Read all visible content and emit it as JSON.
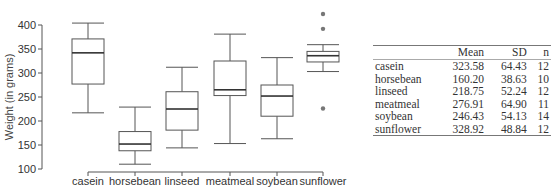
{
  "chart_data": {
    "type": "box",
    "title": "",
    "xlabel": "",
    "ylabel": "Weight (in grams)",
    "ylim": [
      100,
      430
    ],
    "yticks": [
      100,
      150,
      200,
      250,
      300,
      350,
      400
    ],
    "grid": false,
    "categories": [
      "casein",
      "horsebean",
      "linseed",
      "meatmeal",
      "soybean",
      "sunflower"
    ],
    "boxes": [
      {
        "name": "casein",
        "whisker_low": 217,
        "q1": 277,
        "median": 342,
        "q3": 371,
        "whisker_high": 404,
        "outliers": []
      },
      {
        "name": "horsebean",
        "whisker_low": 110,
        "q1": 138,
        "median": 152,
        "q3": 178,
        "whisker_high": 229,
        "outliers": []
      },
      {
        "name": "linseed",
        "whisker_low": 144,
        "q1": 181,
        "median": 225,
        "q3": 261,
        "whisker_high": 312,
        "outliers": []
      },
      {
        "name": "meatmeal",
        "whisker_low": 153,
        "q1": 253,
        "median": 265,
        "q3": 325,
        "whisker_high": 381,
        "outliers": []
      },
      {
        "name": "soybean",
        "whisker_low": 163,
        "q1": 210,
        "median": 252,
        "q3": 275,
        "whisker_high": 332,
        "outliers": []
      },
      {
        "name": "sunflower",
        "whisker_low": 303,
        "q1": 323,
        "median": 336,
        "q3": 345,
        "whisker_high": 359,
        "outliers": [
          423,
          392,
          226
        ]
      }
    ]
  },
  "table": {
    "headers": [
      "",
      "Mean",
      "SD",
      "n"
    ],
    "rows": [
      [
        "casein",
        "323.58",
        "64.43",
        "12"
      ],
      [
        "horsebean",
        "160.20",
        "38.63",
        "10"
      ],
      [
        "linseed",
        "218.75",
        "52.24",
        "12"
      ],
      [
        "meatmeal",
        "276.91",
        "64.90",
        "11"
      ],
      [
        "soybean",
        "246.43",
        "54.13",
        "14"
      ],
      [
        "sunflower",
        "328.92",
        "48.84",
        "12"
      ]
    ]
  }
}
